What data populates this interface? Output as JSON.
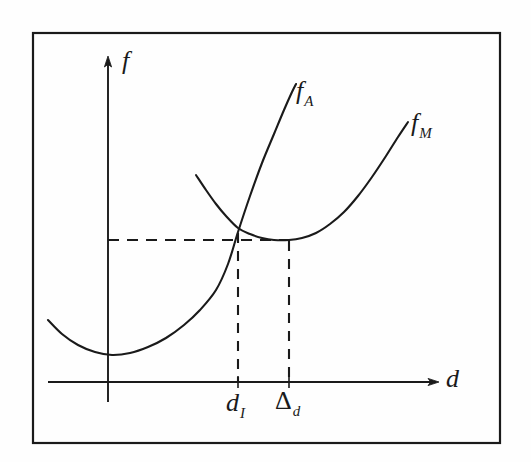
{
  "figure": {
    "kind": "hand-drawn-line-chart",
    "background_color": "#fefefe",
    "ink_color": "#1a1a1a",
    "border": {
      "name": "figure-frame",
      "x": 33,
      "y": 33,
      "width": 467,
      "height": 410
    }
  },
  "axes": {
    "y_axis_label": "f",
    "x_axis_label": "d",
    "origin_px": {
      "x": 108,
      "y": 382
    },
    "y_axis_top_px": 58,
    "y_axis_bottom_px": 402,
    "x_axis_left_px": 48,
    "x_axis_right_px": 437
  },
  "curve_labels": {
    "fa_base": "f",
    "fa_sub": "A",
    "fm_base": "f",
    "fm_sub": "M"
  },
  "tick_labels": {
    "d_i_base": "d",
    "d_i_sub": "I",
    "delta_d_base": "Δ",
    "delta_d_sub": "d"
  },
  "chart_data": {
    "type": "line",
    "title": "",
    "xlabel": "d",
    "ylabel": "f",
    "grid": false,
    "legend": "inline-curve-end-labels",
    "xlim": [
      0,
      1
    ],
    "ylim": [
      0,
      1
    ],
    "annotations": [
      {
        "name": "intersection-point",
        "label": "f_A = f_M",
        "x_px": 238,
        "y_px": 232,
        "note": "crossing of f_A and f_M; horizontal dashed guide runs left to the f axis"
      },
      {
        "name": "fm-minimum",
        "label": "min f_M",
        "x_px": 289,
        "y_px": 240,
        "note": "minimum of f_M; vertical dashed guide drops to tick labelled Delta_d"
      },
      {
        "name": "fa-minimum",
        "label": "min f_A",
        "x_px": 112,
        "y_px": 355,
        "note": "minimum of f_A, essentially on the f axis"
      }
    ],
    "guides": [
      {
        "name": "horizontal-dashed-guide",
        "orientation": "horizontal",
        "y_px": 240,
        "x_start_px": 108,
        "x_end_px": 291
      },
      {
        "name": "vertical-dashed-guide-di",
        "orientation": "vertical",
        "x_px": 238,
        "y_start_px": 233,
        "y_end_px": 382
      },
      {
        "name": "vertical-dashed-guide-delta-d",
        "orientation": "vertical",
        "x_px": 289,
        "y_start_px": 241,
        "y_end_px": 382
      }
    ],
    "x_ticks": [
      {
        "name": "tick-d-i",
        "label": "d_I",
        "x_px": 238
      },
      {
        "name": "tick-delta-d",
        "label": "Δ_d",
        "x_px": 289
      }
    ],
    "series": [
      {
        "name": "f_A",
        "label": "f_A",
        "shape": "convex-parabola",
        "color": "#1a1a1a",
        "points_px": [
          [
            48,
            320
          ],
          [
            62,
            334
          ],
          [
            78,
            345
          ],
          [
            95,
            352
          ],
          [
            112,
            355
          ],
          [
            130,
            353
          ],
          [
            148,
            347
          ],
          [
            166,
            338
          ],
          [
            184,
            325
          ],
          [
            200,
            310
          ],
          [
            216,
            290
          ],
          [
            228,
            264
          ],
          [
            238,
            232
          ],
          [
            250,
            196
          ],
          [
            262,
            163
          ],
          [
            274,
            134
          ],
          [
            284,
            110
          ],
          [
            292,
            92
          ],
          [
            296,
            84
          ]
        ]
      },
      {
        "name": "f_M",
        "label": "f_M",
        "shape": "convex-parabola",
        "color": "#1a1a1a",
        "points_px": [
          [
            196,
            175
          ],
          [
            206,
            190
          ],
          [
            216,
            204
          ],
          [
            226,
            216
          ],
          [
            238,
            228
          ],
          [
            250,
            234
          ],
          [
            262,
            238
          ],
          [
            274,
            240
          ],
          [
            289,
            240
          ],
          [
            302,
            238
          ],
          [
            316,
            233
          ],
          [
            330,
            224
          ],
          [
            344,
            212
          ],
          [
            358,
            196
          ],
          [
            372,
            177
          ],
          [
            386,
            156
          ],
          [
            398,
            137
          ],
          [
            408,
            122
          ]
        ]
      }
    ]
  }
}
